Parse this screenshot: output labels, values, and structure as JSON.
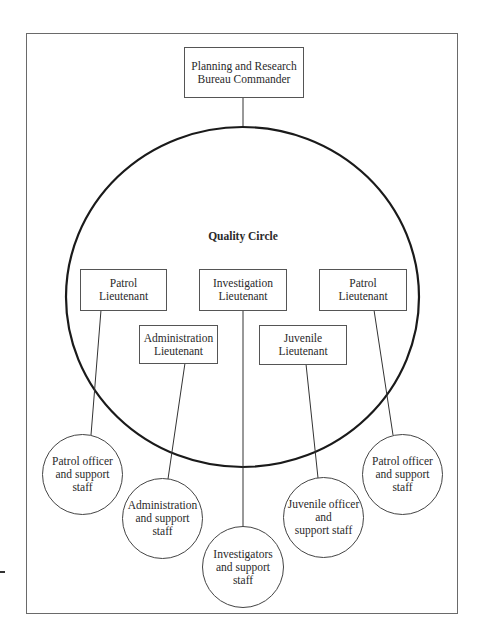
{
  "figure": {
    "circle_label": "Quality Circle",
    "commander": {
      "label": "Planning and Research\nBureau Commander"
    },
    "lieutenants": [
      {
        "id": "patrol-left",
        "label": "Patrol\nLieutenant"
      },
      {
        "id": "administration",
        "label": "Administration\nLieutenant"
      },
      {
        "id": "investigation",
        "label": "Investigation\nLieutenant"
      },
      {
        "id": "juvenile",
        "label": "Juvenile\nLieutenant"
      },
      {
        "id": "patrol-right",
        "label": "Patrol\nLieutenant"
      }
    ],
    "staff_groups": [
      {
        "id": "patrol-left-staff",
        "label": "Patrol officer\nand support\nstaff"
      },
      {
        "id": "administration-staff",
        "label": "Administration\nand support\nstaff"
      },
      {
        "id": "investigation-staff",
        "label": "Investigators\nand support\nstaff"
      },
      {
        "id": "juvenile-staff",
        "label": "Juvenile officer\nand\nsupport staff"
      },
      {
        "id": "patrol-right-staff",
        "label": "Patrol officer\nand support\nstaff"
      }
    ],
    "colors": {
      "stroke": "#222222",
      "box_border": "#555555",
      "background": "#ffffff"
    }
  }
}
